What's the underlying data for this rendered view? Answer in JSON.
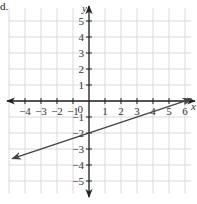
{
  "problem_label": "d.",
  "chart_data": {
    "type": "line",
    "title": "",
    "xlabel": "x",
    "ylabel": "y",
    "xlim": [
      -5,
      6.4
    ],
    "ylim": [
      -5.8,
      5.8
    ],
    "grid": true,
    "x_tick_labels": [
      "-4",
      "-3",
      "-2",
      "-1",
      "1",
      "2",
      "3",
      "4",
      "5",
      "6"
    ],
    "x_ticks": [
      -4,
      -3,
      -2,
      -1,
      1,
      2,
      3,
      4,
      5,
      6
    ],
    "y_tick_labels": [
      "5",
      "4",
      "3",
      "2",
      "1",
      "-1",
      "-2",
      "-3",
      "-4",
      "-5"
    ],
    "y_ticks": [
      5,
      4,
      3,
      2,
      1,
      -1,
      -2,
      -3,
      -4,
      -5
    ],
    "origin_label": "0",
    "series": [
      {
        "name": "line",
        "equation": "y = x/3 - 2",
        "slope": 0.3333,
        "intercept": -2,
        "x": [
          -4.8,
          6.4
        ],
        "y": [
          -3.6,
          0.13
        ],
        "arrows": "both",
        "color": "#444444"
      }
    ]
  },
  "colors": {
    "grid": "#d9d9d9",
    "axis": "#222222",
    "line": "#444444",
    "text": "#333333"
  }
}
